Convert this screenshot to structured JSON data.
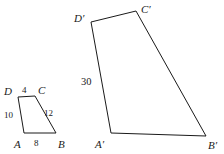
{
  "figure": {
    "background_color": "#ffffff",
    "stroke_color": "#1a1a1a",
    "stroke_width": 1,
    "width": 224,
    "height": 154
  },
  "small_quad": {
    "name": "ABCD",
    "fill": "#ffffff",
    "points": "24,133 56,133 35,96 18,97",
    "vertices": [
      {
        "label": "A",
        "x": 24,
        "y": 133,
        "label_x": 14,
        "label_y": 139
      },
      {
        "label": "B",
        "x": 56,
        "y": 133,
        "label_x": 58,
        "label_y": 139
      },
      {
        "label": "C",
        "x": 35,
        "y": 96,
        "label_x": 38,
        "label_y": 85
      },
      {
        "label": "D",
        "x": 18,
        "y": 97,
        "label_x": 4,
        "label_y": 86
      }
    ],
    "side_labels": [
      {
        "value": "8",
        "side": "AB",
        "x": 34,
        "y": 139
      },
      {
        "value": "12",
        "side": "BC",
        "x": 44,
        "y": 109
      },
      {
        "value": "4",
        "side": "CD",
        "x": 22,
        "y": 86
      },
      {
        "value": "10",
        "side": "DA",
        "x": 4,
        "y": 111
      }
    ]
  },
  "large_quad": {
    "name": "A'B'C'D'",
    "fill": "#ffffff",
    "points": "111,133 206,136 136,11 91,22",
    "vertices": [
      {
        "label": "A′",
        "x": 111,
        "y": 133,
        "label_x": 95,
        "label_y": 139
      },
      {
        "label": "B′",
        "x": 206,
        "y": 136,
        "label_x": 208,
        "label_y": 140
      },
      {
        "label": "C′",
        "x": 136,
        "y": 11,
        "label_x": 141,
        "label_y": 4
      },
      {
        "label": "D′",
        "x": 91,
        "y": 22,
        "label_x": 74,
        "label_y": 13
      }
    ],
    "side_labels": [
      {
        "value": "30",
        "side": "D′A′",
        "x": 81,
        "y": 77
      }
    ]
  }
}
